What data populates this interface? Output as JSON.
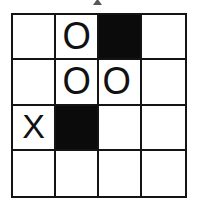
{
  "figure": {
    "kind": "grid-puzzle",
    "rows": 4,
    "columns": 4,
    "colors": {
      "background": "#ffffff",
      "grid_line": "#141414",
      "filled_cell": "#0b0b0b",
      "mark": "#111111"
    },
    "legend": {
      "o_symbol": "O",
      "x_symbol": "X",
      "empty_symbol": ""
    },
    "artifact": {
      "present": true,
      "description": "cut-off-mark-top-center"
    },
    "grid": [
      [
        {
          "state": "empty",
          "symbol": ""
        },
        {
          "state": "o",
          "symbol": "O"
        },
        {
          "state": "filled",
          "symbol": ""
        },
        {
          "state": "empty",
          "symbol": ""
        }
      ],
      [
        {
          "state": "empty",
          "symbol": ""
        },
        {
          "state": "o",
          "symbol": "O"
        },
        {
          "state": "o",
          "symbol": "O"
        },
        {
          "state": "empty",
          "symbol": ""
        }
      ],
      [
        {
          "state": "x",
          "symbol": "X"
        },
        {
          "state": "filled",
          "symbol": ""
        },
        {
          "state": "empty",
          "symbol": ""
        },
        {
          "state": "empty",
          "symbol": ""
        }
      ],
      [
        {
          "state": "empty",
          "symbol": ""
        },
        {
          "state": "empty",
          "symbol": ""
        },
        {
          "state": "empty",
          "symbol": ""
        },
        {
          "state": "empty",
          "symbol": ""
        }
      ]
    ]
  }
}
